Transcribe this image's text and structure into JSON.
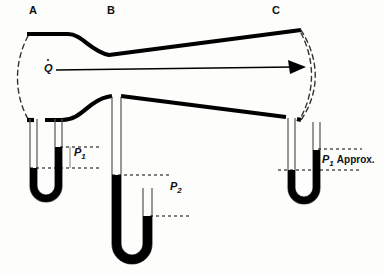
{
  "figure": {
    "background_color": "#fdfdfb",
    "ink_color": "#111111"
  },
  "stations": [
    {
      "id": "A",
      "label": "A",
      "x": 33,
      "y": 6,
      "role": "inlet-station"
    },
    {
      "id": "B",
      "label": "B",
      "x": 110,
      "y": 6,
      "role": "throat-station"
    },
    {
      "id": "C",
      "label": "C",
      "x": 275,
      "y": 6,
      "role": "outlet-station"
    }
  ],
  "flow": {
    "symbol": "Q",
    "has_dot": true,
    "description": "volumetric flow rate",
    "arrow": {
      "x_start": 56,
      "x_end": 305,
      "y": 68,
      "direction": "right"
    }
  },
  "manometers": [
    {
      "id": "manometer-a",
      "station": "A",
      "label": "P",
      "subscript": "1",
      "suffix": "",
      "label_x": 76,
      "label_y": 152,
      "left_leg_x": 33,
      "right_leg_x": 62,
      "tube_top_y": 118,
      "bend_bottom_y": 212,
      "left_level_y": 168,
      "right_level_y": 148,
      "dash_lines": [
        {
          "x1": 33,
          "x2": 100,
          "y": 168
        },
        {
          "x1": 62,
          "x2": 100,
          "y": 147
        }
      ]
    },
    {
      "id": "manometer-b",
      "station": "B",
      "label": "P",
      "subscript": "2",
      "suffix": "",
      "label_x": 172,
      "label_y": 186,
      "left_leg_x": 116,
      "right_leg_x": 152,
      "tube_top_y": 110,
      "bend_bottom_y": 268,
      "left_level_y": 175,
      "right_level_y": 216,
      "dash_lines": [
        {
          "x1": 116,
          "x2": 168,
          "y": 175
        },
        {
          "x1": 152,
          "x2": 190,
          "y": 216
        }
      ]
    },
    {
      "id": "manometer-c",
      "station": "C",
      "label": "P",
      "subscript": "1",
      "suffix": "Approx.",
      "label_x": 324,
      "label_y": 159,
      "left_leg_x": 290,
      "right_leg_x": 316,
      "tube_top_y": 122,
      "bend_bottom_y": 212,
      "left_level_y": 170,
      "right_level_y": 150,
      "dash_lines": [
        {
          "x1": 290,
          "x2": 360,
          "y": 170
        },
        {
          "x1": 316,
          "x2": 360,
          "y": 149
        }
      ]
    }
  ],
  "duct": {
    "upper_wall": "M 28,34 L 70,34 C 84,34 92,52 110,55 L 300,30",
    "lower_wall": "M 28,120 L 60,120 C 82,120 88,100 108,97 L 300,118",
    "inlet_arc": "M 28,36 C 16,62 16,92 28,118",
    "outlet_arc_outer": "M 300,30 C 318,60 318,90 300,118",
    "outlet_arc_inner": "M 300,33 C 314,60 314,90 300,115",
    "throat_note": "converging section A to B, diverging section B to C"
  }
}
